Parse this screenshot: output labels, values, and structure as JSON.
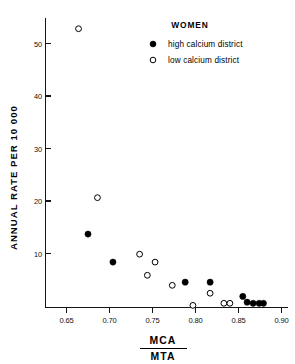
{
  "chart_data": {
    "type": "scatter",
    "title": "WOMEN",
    "xlabel_numerator": "MCA",
    "xlabel_denominator": "MTA",
    "ylabel": "ANNUAL RATE  PER 10 000",
    "xlim": [
      0.625,
      0.905
    ],
    "ylim": [
      0,
      56
    ],
    "xticks": [
      0.65,
      0.7,
      0.75,
      0.8,
      0.85,
      0.9
    ],
    "xtick_labels": [
      "0.65",
      "0.70",
      "0.75",
      "0.80",
      "0.85",
      "0.90"
    ],
    "yticks": [
      10,
      20,
      30,
      40,
      50
    ],
    "ytick_labels": [
      "10",
      "20",
      "30",
      "40",
      "50"
    ],
    "grid": false,
    "legend_position": "top-right",
    "series": [
      {
        "name": "high calcium district",
        "marker": "filled-circle",
        "color": "#000000",
        "points": [
          {
            "x": 0.675,
            "y": 13.9
          },
          {
            "x": 0.704,
            "y": 8.6
          },
          {
            "x": 0.788,
            "y": 4.8
          },
          {
            "x": 0.817,
            "y": 4.8
          },
          {
            "x": 0.855,
            "y": 2.1
          },
          {
            "x": 0.86,
            "y": 1.0
          },
          {
            "x": 0.867,
            "y": 0.8
          },
          {
            "x": 0.874,
            "y": 0.8
          },
          {
            "x": 0.879,
            "y": 0.8
          }
        ]
      },
      {
        "name": "low calcium district",
        "marker": "open-circle",
        "color": "#000000",
        "points": [
          {
            "x": 0.664,
            "y": 52.8
          },
          {
            "x": 0.686,
            "y": 20.8
          },
          {
            "x": 0.735,
            "y": 10.1
          },
          {
            "x": 0.753,
            "y": 8.6
          },
          {
            "x": 0.744,
            "y": 6.1
          },
          {
            "x": 0.773,
            "y": 4.2
          },
          {
            "x": 0.797,
            "y": 0.4
          },
          {
            "x": 0.817,
            "y": 2.7
          },
          {
            "x": 0.833,
            "y": 0.8
          },
          {
            "x": 0.84,
            "y": 0.8
          }
        ]
      }
    ]
  },
  "legend": {
    "title": "WOMEN",
    "entries": [
      {
        "label": "high calcium district",
        "marker": "filled-circle"
      },
      {
        "label": "low calcium district",
        "marker": "open-circle"
      }
    ]
  }
}
